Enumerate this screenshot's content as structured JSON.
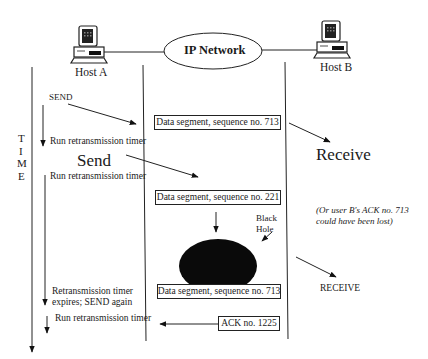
{
  "network": {
    "label": "IP Network"
  },
  "hosts": {
    "a": {
      "label": "Host A",
      "icon": "computer-icon"
    },
    "b": {
      "label": "Host B",
      "icon": "computer-icon"
    }
  },
  "time_axis": {
    "letters": [
      "T",
      "I",
      "M",
      "E"
    ]
  },
  "host_a_events": {
    "send1": "SEND",
    "timer1": "Run retransmission timer",
    "send2": "Send",
    "timer2": "Run retransmission timer",
    "expire_line1": "Retransmission timer",
    "expire_line2": "expires; SEND again",
    "timer3": "Run retransmission timer"
  },
  "segments": {
    "seg1": "Data segment, sequence no. 713",
    "seg2": "Data segment, sequence no. 221",
    "seg3": "Data segment, sequence no. 713",
    "ack": "ACK no. 1225"
  },
  "black_hole": {
    "label_line1": "Black",
    "label_line2": "Hole"
  },
  "host_b_events": {
    "receive1": "Receive",
    "note_line1": "(Or user B's ACK no. 713",
    "note_line2": "could have been lost)",
    "receive2": "RECEIVE"
  }
}
